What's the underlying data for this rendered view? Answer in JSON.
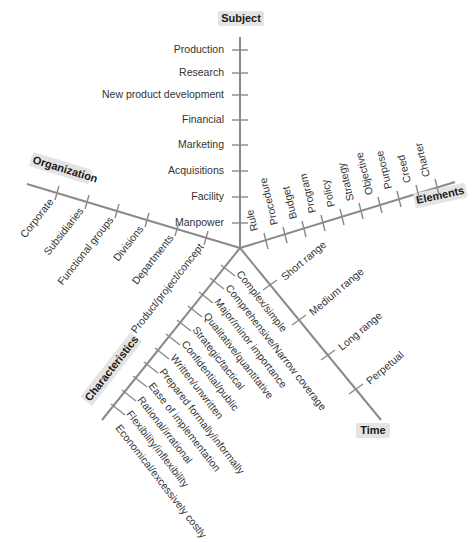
{
  "diagram": {
    "center": [
      240,
      248
    ],
    "axes": {
      "subject": {
        "title": "Subject",
        "items": [
          "Production",
          "Research",
          "New product development",
          "Financial",
          "Marketing",
          "Acquisitions",
          "Facility",
          "Manpower"
        ]
      },
      "elements": {
        "title": "Elements",
        "items": [
          "Rule",
          "Procedure",
          "Budget",
          "Program",
          "Policy",
          "Strategy",
          "Objective",
          "Purpose",
          "Creed",
          "Charter"
        ]
      },
      "time": {
        "title": "Time",
        "items": [
          "Short range",
          "Medium range",
          "Long range",
          "Perpetual"
        ]
      },
      "characteristics": {
        "title": "Characteristics",
        "items": [
          "Complex/simple",
          "Comprehensive/Narrow coverage",
          "Major/minor importance",
          "Qualitative/quantitative",
          "Strategic/tactical",
          "Confidential/public",
          "Written/unwritten",
          "Prepared formally/informally",
          "Ease of implementation",
          "Rational/irrational",
          "Flexibility/inflexibility",
          "Economical/excessively costly"
        ]
      },
      "organization": {
        "title": "Organization",
        "items": [
          "Corporate",
          "Subsidiaries",
          "Functional groups",
          "Divisions",
          "Departments",
          "Product/project/concept"
        ]
      }
    },
    "colors": {
      "axis": "#8a8a8a",
      "text": "#333333",
      "title_bg": "#e4e4e4"
    }
  }
}
